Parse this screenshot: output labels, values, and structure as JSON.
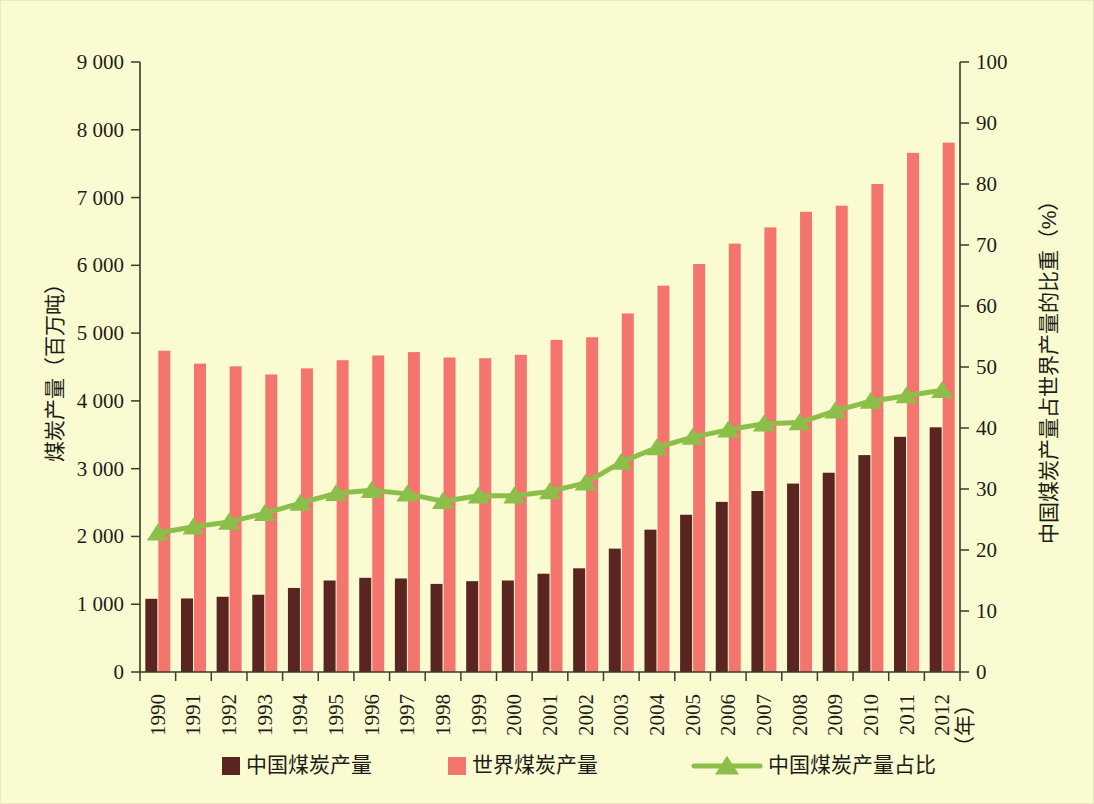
{
  "figure": {
    "background_color": "#fbfbd2",
    "plot_left": 140,
    "plot_right": 960,
    "plot_top": 62,
    "plot_bottom": 672
  },
  "colors": {
    "china_bar": "#5a2420",
    "world_bar": "#f4756e",
    "share_line": "#8cbf4a",
    "axis": "#3a3a30",
    "text": "#1d1d17"
  },
  "chart_data": {
    "type": "bar",
    "title": "",
    "subtitle": "",
    "xlabel": "（年）",
    "ylabel": "煤炭产量（百万吨）",
    "y2label": "中国煤炭产量占世界产量的比重（%）",
    "grid": false,
    "legend_position": "bottom",
    "ylim": [
      0,
      9000
    ],
    "y2lim": [
      0,
      100
    ],
    "yticks": [
      "0",
      "1 000",
      "2 000",
      "3 000",
      "4 000",
      "5 000",
      "6 000",
      "7 000",
      "8 000",
      "9 000"
    ],
    "ytick_values": [
      0,
      1000,
      2000,
      3000,
      4000,
      5000,
      6000,
      7000,
      8000,
      9000
    ],
    "y2ticks": [
      "0",
      "10",
      "20",
      "30",
      "40",
      "50",
      "60",
      "70",
      "80",
      "90",
      "100"
    ],
    "y2tick_values": [
      0,
      10,
      20,
      30,
      40,
      50,
      60,
      70,
      80,
      90,
      100
    ],
    "categories": [
      "1990",
      "1991",
      "1992",
      "1993",
      "1994",
      "1995",
      "1996",
      "1997",
      "1998",
      "1999",
      "2000",
      "2001",
      "2002",
      "2003",
      "2004",
      "2005",
      "2006",
      "2007",
      "2008",
      "2009",
      "2010",
      "2011",
      "2012"
    ],
    "series": [
      {
        "name": "中国煤炭产量",
        "kind": "bar",
        "axis": "left",
        "color": "#5a2420",
        "values": [
          1080,
          1085,
          1110,
          1140,
          1240,
          1350,
          1390,
          1380,
          1300,
          1340,
          1350,
          1450,
          1530,
          1820,
          2100,
          2320,
          2510,
          2670,
          2780,
          2940,
          3200,
          3470,
          3610
        ]
      },
      {
        "name": "世界煤炭产量",
        "kind": "bar",
        "axis": "left",
        "color": "#f4756e",
        "values": [
          4740,
          4550,
          4510,
          4390,
          4480,
          4600,
          4670,
          4720,
          4640,
          4630,
          4680,
          4900,
          4940,
          5290,
          5700,
          6020,
          6320,
          6560,
          6790,
          6880,
          7200,
          7660,
          7810
        ]
      },
      {
        "name": "中国煤炭产量占比",
        "kind": "line",
        "axis": "right",
        "color": "#8cbf4a",
        "marker": "triangle",
        "values": [
          22.8,
          23.8,
          24.6,
          26.0,
          27.7,
          29.3,
          29.8,
          29.2,
          28.0,
          28.9,
          28.9,
          29.6,
          31.0,
          34.4,
          36.8,
          38.5,
          39.7,
          40.7,
          40.9,
          42.8,
          44.4,
          45.3,
          46.2
        ]
      }
    ]
  },
  "legend": {
    "items": [
      {
        "label": "中国煤炭产量",
        "type": "square",
        "color": "#5a2420"
      },
      {
        "label": "世界煤炭产量",
        "type": "square",
        "color": "#f4756e"
      },
      {
        "label": "中国煤炭产量占比",
        "type": "line-marker",
        "color": "#8cbf4a"
      }
    ]
  }
}
